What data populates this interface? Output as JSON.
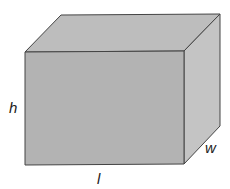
{
  "diagram": {
    "type": "rectangular-prism",
    "labels": {
      "height": "h",
      "length": "l",
      "width": "w"
    },
    "colors": {
      "front_face": "#b3b3b3",
      "top_face": "#bdbdbd",
      "side_face": "#c4c4c4",
      "edge": "#444444"
    }
  }
}
